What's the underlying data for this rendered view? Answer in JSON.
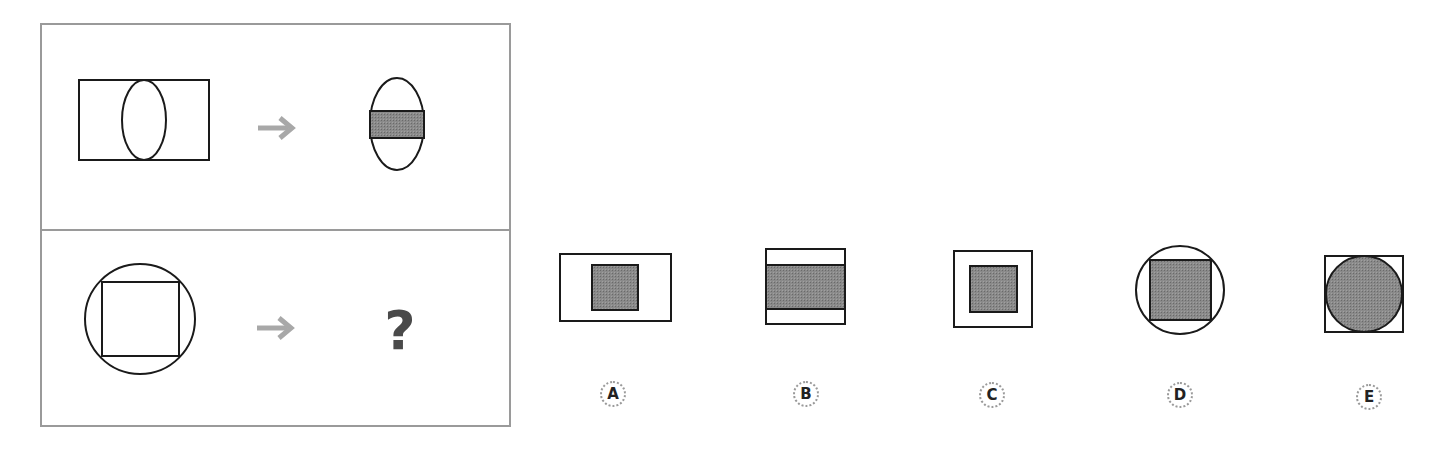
{
  "puzzle": {
    "example_row": {
      "source_figure": "rectangle with inscribed vertical ellipse",
      "result_figure": "ellipse with shaded horizontal band rectangle",
      "arrow": "arrow-right"
    },
    "question_row": {
      "source_figure": "circle with inscribed square",
      "question_mark": "?",
      "arrow": "arrow-right"
    },
    "options": [
      {
        "label": "A",
        "figure": "rectangle with small shaded square centered"
      },
      {
        "label": "B",
        "figure": "rectangle with shaded horizontal band"
      },
      {
        "label": "C",
        "figure": "square with smaller shaded square centered"
      },
      {
        "label": "D",
        "figure": "circle with shaded inscribed square"
      },
      {
        "label": "E",
        "figure": "square with shaded inscribed circle"
      }
    ]
  },
  "colors": {
    "stroke": "#1a1a1a",
    "shade": "#7f7f7f",
    "panel_border": "#9a9a9a",
    "arrow": "#a8a8a8",
    "question_mark": "#4a4a4a"
  }
}
